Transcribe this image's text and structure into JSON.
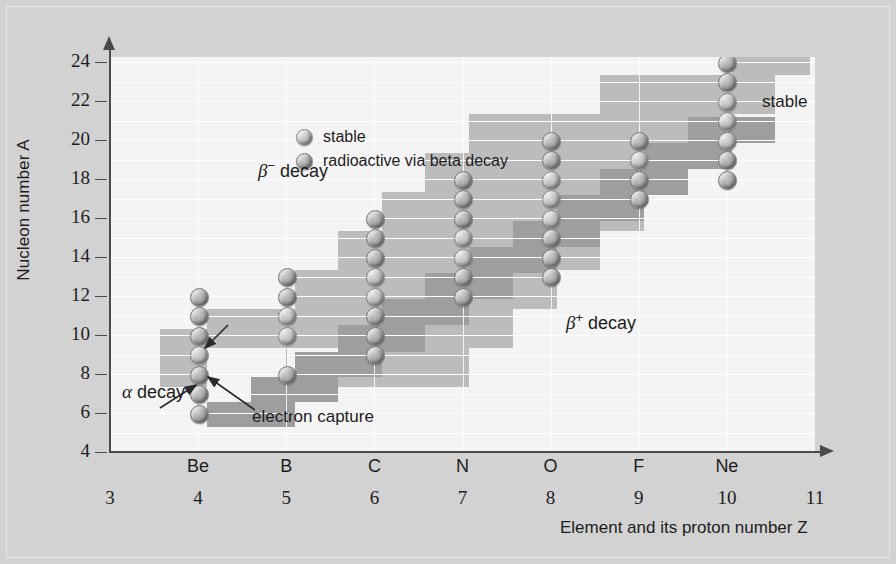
{
  "figure": {
    "background_color": "#d2d2d2",
    "plot_background_color": "#f4f4f4"
  },
  "axes": {
    "y_title": "Nucleon number A",
    "y_ticks": [
      4,
      6,
      8,
      10,
      12,
      14,
      16,
      18,
      20,
      22,
      24
    ],
    "x_title": "Element and its proton number Z",
    "x_symbols": [
      "",
      "Be",
      "B",
      "C",
      "N",
      "O",
      "F",
      "Ne",
      ""
    ],
    "x_numbers": [
      3,
      4,
      5,
      6,
      7,
      8,
      9,
      10,
      11
    ]
  },
  "legend": {
    "items": [
      {
        "marker": "stable",
        "label": "stable"
      },
      {
        "marker": "radioactive",
        "label": "radioactive via beta decay"
      }
    ]
  },
  "annotations": [
    {
      "name": "beta-minus-decay",
      "text_prefix": "β",
      "text_sup": "−",
      "text_suffix": " decay",
      "x": 258,
      "y": 160
    },
    {
      "name": "beta-plus-decay",
      "text_prefix": "β",
      "text_sup": "+",
      "text_suffix": " decay",
      "x": 565,
      "y": 312
    },
    {
      "name": "alpha-decay",
      "text_prefix": "α",
      "text_sup": "",
      "text_suffix": " decay",
      "x": 124,
      "y": 383
    },
    {
      "name": "electron-capture",
      "text_prefix": "",
      "text_sup": "",
      "text_suffix": "electron capture",
      "x": 252,
      "y": 415
    },
    {
      "name": "stable-band-label",
      "text_prefix": "",
      "text_sup": "",
      "text_suffix": "stable",
      "x": 762,
      "y": 100
    }
  ],
  "colors": {
    "band_beta_minus": "#b9b9b9",
    "band_beta_plus": "#9c9c9c",
    "axis": "#4a4a4a",
    "gridline": "#ffffff",
    "text": "#1d1d1d"
  },
  "chart_data": {
    "type": "scatter",
    "title": "",
    "xlabel": "Element and its proton number Z",
    "ylabel": "Nucleon number A",
    "xlim": [
      3,
      11
    ],
    "ylim": [
      4,
      24
    ],
    "grid": true,
    "legend_position": "top-left-inside",
    "xtick_labels": [
      "3",
      "4",
      "5",
      "6",
      "7",
      "8",
      "9",
      "10",
      "11"
    ],
    "xtick_elements": [
      "",
      "Be",
      "B",
      "C",
      "N",
      "O",
      "F",
      "Ne",
      ""
    ],
    "ytick_labels": [
      "4",
      "6",
      "8",
      "10",
      "12",
      "14",
      "16",
      "18",
      "20",
      "22",
      "24"
    ],
    "series": [
      {
        "name": "Be (Z=4)",
        "z": 4,
        "points": [
          {
            "A": 12,
            "marker": "radioactive"
          },
          {
            "A": 11,
            "marker": "radioactive"
          },
          {
            "A": 10,
            "marker": "radioactive"
          },
          {
            "A": 9,
            "marker": "stable"
          },
          {
            "A": 8,
            "marker": "radioactive"
          },
          {
            "A": 7,
            "marker": "radioactive"
          },
          {
            "A": 6,
            "marker": "radioactive"
          }
        ]
      },
      {
        "name": "B (Z=5)",
        "z": 5,
        "points": [
          {
            "A": 13,
            "marker": "radioactive"
          },
          {
            "A": 12,
            "marker": "radioactive"
          },
          {
            "A": 11,
            "marker": "stable"
          },
          {
            "A": 10,
            "marker": "stable"
          },
          {
            "A": 8,
            "marker": "radioactive"
          }
        ]
      },
      {
        "name": "C (Z=6)",
        "z": 6,
        "points": [
          {
            "A": 16,
            "marker": "radioactive"
          },
          {
            "A": 15,
            "marker": "radioactive"
          },
          {
            "A": 14,
            "marker": "radioactive"
          },
          {
            "A": 13,
            "marker": "stable"
          },
          {
            "A": 12,
            "marker": "stable"
          },
          {
            "A": 11,
            "marker": "radioactive"
          },
          {
            "A": 10,
            "marker": "radioactive"
          },
          {
            "A": 9,
            "marker": "radioactive"
          }
        ]
      },
      {
        "name": "N (Z=7)",
        "z": 7,
        "points": [
          {
            "A": 18,
            "marker": "radioactive"
          },
          {
            "A": 17,
            "marker": "radioactive"
          },
          {
            "A": 16,
            "marker": "radioactive"
          },
          {
            "A": 15,
            "marker": "stable"
          },
          {
            "A": 14,
            "marker": "stable"
          },
          {
            "A": 13,
            "marker": "radioactive"
          },
          {
            "A": 12,
            "marker": "radioactive"
          }
        ]
      },
      {
        "name": "O (Z=8)",
        "z": 8,
        "points": [
          {
            "A": 20,
            "marker": "radioactive"
          },
          {
            "A": 19,
            "marker": "radioactive"
          },
          {
            "A": 18,
            "marker": "stable"
          },
          {
            "A": 17,
            "marker": "stable"
          },
          {
            "A": 16,
            "marker": "stable"
          },
          {
            "A": 15,
            "marker": "radioactive"
          },
          {
            "A": 14,
            "marker": "radioactive"
          },
          {
            "A": 13,
            "marker": "radioactive"
          }
        ]
      },
      {
        "name": "F (Z=9)",
        "z": 9,
        "points": [
          {
            "A": 20,
            "marker": "radioactive"
          },
          {
            "A": 19,
            "marker": "stable"
          },
          {
            "A": 18,
            "marker": "radioactive"
          },
          {
            "A": 17,
            "marker": "radioactive"
          }
        ]
      },
      {
        "name": "Ne (Z=10)",
        "z": 10,
        "points": [
          {
            "A": 24,
            "marker": "radioactive"
          },
          {
            "A": 23,
            "marker": "radioactive"
          },
          {
            "A": 22,
            "marker": "stable"
          },
          {
            "A": 21,
            "marker": "stable"
          },
          {
            "A": 20,
            "marker": "stable"
          },
          {
            "A": 19,
            "marker": "radioactive"
          },
          {
            "A": 18,
            "marker": "radioactive"
          }
        ]
      }
    ],
    "bands": [
      {
        "name": "beta-minus-region",
        "label": "β− decay",
        "color": "#b9b9b9"
      },
      {
        "name": "beta-plus-region",
        "label": "β+ decay",
        "color": "#9c9c9c"
      }
    ]
  }
}
